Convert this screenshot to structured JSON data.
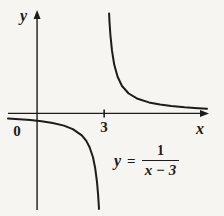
{
  "chart_data": {
    "type": "line",
    "title": "",
    "function": "y = 1/(x-3)",
    "asymptote_x": 3,
    "xlabel": "x",
    "ylabel": "y",
    "origin_label": "0",
    "xticks": [
      {
        "value": 3,
        "label": "3"
      }
    ],
    "xlim": [
      -1.3,
      7.6
    ],
    "ylim": [
      -4.4,
      4.62
    ],
    "grid": false,
    "axis_color": "#1c1c1c",
    "curve_color": "#1c1c1c",
    "series": [
      {
        "name": "left-branch",
        "points": [
          [
            -1.3,
            -0.233
          ],
          [
            -0.8,
            -0.263
          ],
          [
            -0.3,
            -0.303
          ],
          [
            0.2,
            -0.357
          ],
          [
            0.7,
            -0.435
          ],
          [
            1.2,
            -0.556
          ],
          [
            1.6,
            -0.714
          ],
          [
            2.0,
            -1.0
          ],
          [
            2.2,
            -1.25
          ],
          [
            2.35,
            -1.538
          ],
          [
            2.5,
            -2.0
          ],
          [
            2.6,
            -2.5
          ],
          [
            2.68,
            -3.125
          ],
          [
            2.73,
            -3.704
          ],
          [
            2.77,
            -4.35
          ]
        ]
      },
      {
        "name": "right-branch",
        "points": [
          [
            3.22,
            4.545
          ],
          [
            3.24,
            4.167
          ],
          [
            3.28,
            3.571
          ],
          [
            3.35,
            2.857
          ],
          [
            3.45,
            2.222
          ],
          [
            3.6,
            1.667
          ],
          [
            3.8,
            1.25
          ],
          [
            4.1,
            0.909
          ],
          [
            4.5,
            0.667
          ],
          [
            5.0,
            0.5
          ],
          [
            5.5,
            0.4
          ],
          [
            6.0,
            0.333
          ],
          [
            6.6,
            0.278
          ],
          [
            7.2,
            0.238
          ],
          [
            7.6,
            0.217
          ]
        ]
      }
    ],
    "equation_label": {
      "lhs": "y",
      "equals": "=",
      "numerator": "1",
      "denominator": "x − 3"
    }
  }
}
